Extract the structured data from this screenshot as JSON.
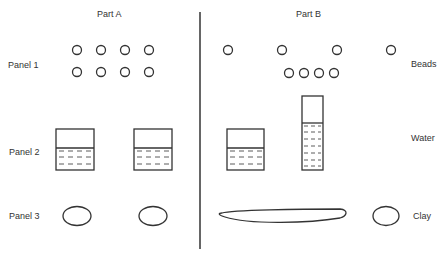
{
  "headers": {
    "part_a": "Part A",
    "part_b": "Part B"
  },
  "row_labels": {
    "panel_1": "Panel 1",
    "panel_2": "Panel 2",
    "panel_3": "Panel 3"
  },
  "side_labels": {
    "beads": "Beads",
    "water": "Water",
    "clay": "Clay"
  },
  "colors": {
    "stroke": "#333333",
    "background": "#ffffff"
  },
  "panel_1": {
    "part_a": {
      "rows": [
        [
          [
            77,
            50
          ],
          [
            101,
            50
          ],
          [
            125,
            50
          ],
          [
            149,
            50
          ]
        ],
        [
          [
            77,
            72
          ],
          [
            101,
            72
          ],
          [
            125,
            72
          ],
          [
            149,
            72
          ]
        ]
      ]
    },
    "part_b": {
      "top": [
        [
          228,
          50
        ],
        [
          282,
          50
        ],
        [
          337,
          50
        ],
        [
          391,
          50
        ]
      ],
      "bottom": [
        [
          289,
          72
        ],
        [
          304,
          72
        ],
        [
          319,
          72
        ],
        [
          334,
          72
        ]
      ]
    }
  },
  "panel_2": {
    "part_a": [
      {
        "shape": "beaker",
        "x": 56,
        "y": 129,
        "w": 38,
        "h": 41,
        "water_y": 148
      },
      {
        "shape": "beaker",
        "x": 134,
        "y": 129,
        "w": 38,
        "h": 41,
        "water_y": 148
      }
    ],
    "part_b": [
      {
        "shape": "beaker",
        "x": 227,
        "y": 129,
        "w": 37,
        "h": 41,
        "water_y": 148
      },
      {
        "shape": "cylinder",
        "x": 302,
        "y": 96,
        "w": 21,
        "h": 74,
        "water_y": 123
      }
    ]
  },
  "panel_3": {
    "part_a": [
      {
        "cx": 77,
        "cy": 216,
        "rx": 14,
        "ry": 10
      },
      {
        "cx": 153,
        "cy": 216,
        "rx": 14,
        "ry": 10
      }
    ],
    "part_b": [
      {
        "shape": "elongated",
        "x1": 220,
        "x2": 346,
        "cy": 216
      },
      {
        "shape": "ball",
        "cx": 386,
        "cy": 216,
        "rx": 13,
        "ry": 10
      }
    ]
  }
}
